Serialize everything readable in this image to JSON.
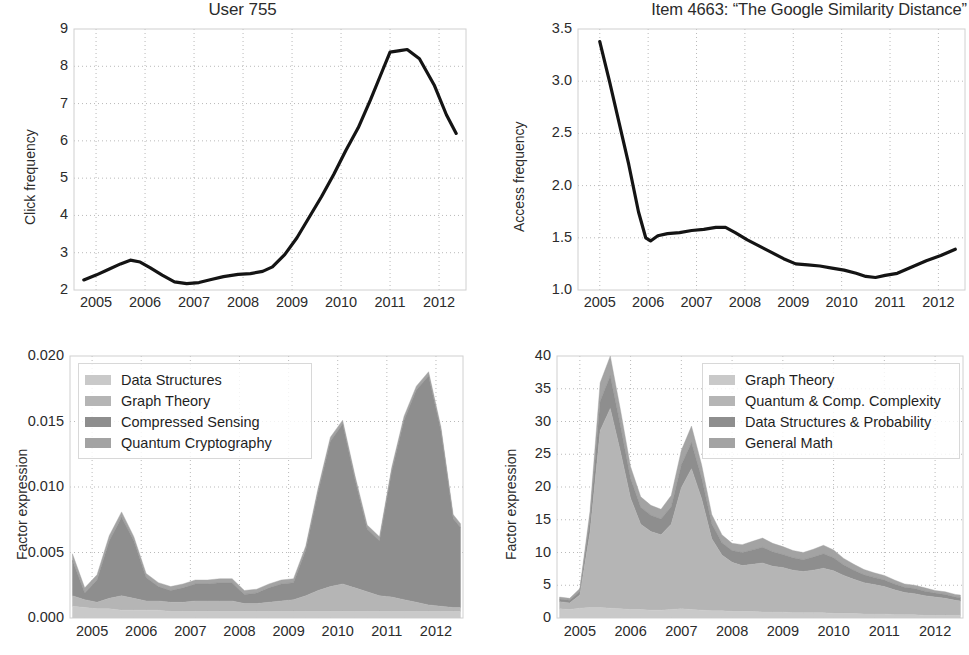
{
  "figure": {
    "width": 969,
    "height": 655,
    "background": "#ffffff",
    "line_color": "#141414",
    "grid_color": "#b9b9b9",
    "frame_color": "#d0d0d0",
    "text_color": "#2b2b2b"
  },
  "panels": {
    "top_left": {
      "title": "User 755",
      "ylabel": "Click frequency",
      "xticks": [
        "2005",
        "2006",
        "2007",
        "2008",
        "2009",
        "2010",
        "2011",
        "2012"
      ],
      "yticks": [
        "2",
        "3",
        "4",
        "5",
        "6",
        "7",
        "8",
        "9"
      ]
    },
    "top_right": {
      "title": "Item 4663: “The Google Similarity Distance”",
      "ylabel": "Access frequency",
      "xticks": [
        "2005",
        "2006",
        "2007",
        "2008",
        "2009",
        "2010",
        "2011",
        "2012"
      ],
      "yticks": [
        "1.0",
        "1.5",
        "2.0",
        "2.5",
        "3.0",
        "3.5"
      ]
    },
    "bottom_left": {
      "ylabel": "Factor expression",
      "xticks": [
        "2005",
        "2006",
        "2007",
        "2008",
        "2009",
        "2010",
        "2011",
        "2012"
      ],
      "yticks": [
        "0.000",
        "0.005",
        "0.010",
        "0.015",
        "0.020"
      ],
      "legend": [
        {
          "label": "Data Structures",
          "color": "#c9c9c9"
        },
        {
          "label": "Graph Theory",
          "color": "#b5b5b5"
        },
        {
          "label": "Compressed Sensing",
          "color": "#8e8e8e"
        },
        {
          "label": "Quantum Cryptography",
          "color": "#a3a3a3"
        }
      ]
    },
    "bottom_right": {
      "ylabel": "Factor expression",
      "xticks": [
        "2005",
        "2006",
        "2007",
        "2008",
        "2009",
        "2010",
        "2011",
        "2012"
      ],
      "yticks": [
        "0",
        "5",
        "10",
        "15",
        "20",
        "25",
        "30",
        "35",
        "40"
      ],
      "legend": [
        {
          "label": "Graph Theory",
          "color": "#c9c9c9"
        },
        {
          "label": "Quantum & Comp. Complexity",
          "color": "#b5b5b5"
        },
        {
          "label": "Data Structures & Probability",
          "color": "#8e8e8e"
        },
        {
          "label": "General Math",
          "color": "#a3a3a3"
        }
      ]
    }
  },
  "chart_data": [
    {
      "id": "user-755-click-frequency",
      "type": "line",
      "title": "User 755",
      "xlabel": "",
      "ylabel": "Click frequency",
      "xlim": [
        2004.55,
        2012.55
      ],
      "ylim": [
        2,
        9
      ],
      "grid": true,
      "legend": null,
      "x": [
        2004.75,
        2005.0,
        2005.25,
        2005.5,
        2005.7,
        2005.9,
        2006.1,
        2006.35,
        2006.6,
        2006.85,
        2007.1,
        2007.35,
        2007.6,
        2007.9,
        2008.15,
        2008.4,
        2008.6,
        2008.85,
        2009.1,
        2009.35,
        2009.6,
        2009.85,
        2010.1,
        2010.35,
        2010.6,
        2010.85,
        2011.0,
        2011.2,
        2011.35,
        2011.6,
        2011.9,
        2012.15,
        2012.35
      ],
      "values": [
        2.27,
        2.4,
        2.55,
        2.7,
        2.8,
        2.75,
        2.6,
        2.4,
        2.22,
        2.17,
        2.2,
        2.28,
        2.36,
        2.42,
        2.44,
        2.5,
        2.62,
        2.95,
        3.4,
        3.95,
        4.5,
        5.1,
        5.75,
        6.35,
        7.1,
        7.9,
        8.38,
        8.42,
        8.45,
        8.2,
        7.5,
        6.7,
        6.2
      ]
    },
    {
      "id": "item-4663-access-frequency",
      "type": "line",
      "title": "Item 4663: “The Google Similarity Distance”",
      "xlabel": "",
      "ylabel": "Access frequency",
      "xlim": [
        2004.55,
        2012.55
      ],
      "ylim": [
        1.0,
        3.5
      ],
      "grid": true,
      "legend": null,
      "x": [
        2005.0,
        2005.2,
        2005.4,
        2005.6,
        2005.8,
        2005.95,
        2006.05,
        2006.2,
        2006.4,
        2006.65,
        2006.9,
        2007.15,
        2007.4,
        2007.6,
        2007.8,
        2008.05,
        2008.3,
        2008.55,
        2008.8,
        2009.05,
        2009.3,
        2009.55,
        2009.8,
        2010.05,
        2010.3,
        2010.5,
        2010.7,
        2010.9,
        2011.15,
        2011.45,
        2011.75,
        2012.05,
        2012.35
      ],
      "values": [
        3.38,
        3.0,
        2.6,
        2.2,
        1.75,
        1.5,
        1.47,
        1.52,
        1.54,
        1.55,
        1.57,
        1.58,
        1.6,
        1.6,
        1.55,
        1.48,
        1.42,
        1.36,
        1.3,
        1.25,
        1.24,
        1.23,
        1.21,
        1.19,
        1.16,
        1.13,
        1.12,
        1.14,
        1.16,
        1.22,
        1.28,
        1.33,
        1.39
      ]
    },
    {
      "id": "user-755-factor-expression",
      "type": "area",
      "stacked": true,
      "title": "",
      "xlabel": "",
      "ylabel": "Factor expression",
      "xlim": [
        2004.55,
        2012.55
      ],
      "ylim": [
        0.0,
        0.02
      ],
      "grid": true,
      "legend_position": "upper-left",
      "x": [
        2004.6,
        2004.85,
        2005.1,
        2005.35,
        2005.6,
        2005.85,
        2006.1,
        2006.35,
        2006.6,
        2006.85,
        2007.1,
        2007.35,
        2007.6,
        2007.85,
        2008.1,
        2008.35,
        2008.6,
        2008.85,
        2009.1,
        2009.35,
        2009.6,
        2009.85,
        2010.1,
        2010.35,
        2010.6,
        2010.85,
        2011.1,
        2011.35,
        2011.6,
        2011.85,
        2012.1,
        2012.35,
        2012.5
      ],
      "series": [
        {
          "name": "Data Structures",
          "color": "#c9c9c9",
          "values": [
            0.0009,
            0.0008,
            0.0007,
            0.0007,
            0.0006,
            0.0006,
            0.0006,
            0.0006,
            0.0005,
            0.0005,
            0.0005,
            0.0005,
            0.0005,
            0.0005,
            0.0005,
            0.0005,
            0.0005,
            0.0005,
            0.0005,
            0.0005,
            0.0005,
            0.0005,
            0.0005,
            0.0005,
            0.0005,
            0.0005,
            0.0005,
            0.0005,
            0.0005,
            0.0005,
            0.0005,
            0.0005,
            0.0005
          ]
        },
        {
          "name": "Graph Theory",
          "color": "#b5b5b5",
          "values": [
            0.0008,
            0.0006,
            0.0005,
            0.0008,
            0.0011,
            0.0009,
            0.0007,
            0.0007,
            0.0007,
            0.0007,
            0.0008,
            0.0008,
            0.0008,
            0.0008,
            0.0006,
            0.0006,
            0.0007,
            0.0008,
            0.0009,
            0.0012,
            0.0016,
            0.0019,
            0.0021,
            0.0018,
            0.0015,
            0.0012,
            0.0011,
            0.0009,
            0.0007,
            0.0005,
            0.0004,
            0.0003,
            0.0003
          ]
        },
        {
          "name": "Compressed Sensing",
          "color": "#8e8e8e",
          "values": [
            0.0027,
            0.0005,
            0.0017,
            0.0044,
            0.006,
            0.0044,
            0.0018,
            0.0011,
            0.0009,
            0.0011,
            0.0013,
            0.0013,
            0.0014,
            0.0014,
            0.0007,
            0.0008,
            0.0011,
            0.0013,
            0.0013,
            0.0035,
            0.0075,
            0.0111,
            0.0122,
            0.0083,
            0.0048,
            0.0042,
            0.0096,
            0.0137,
            0.0162,
            0.0175,
            0.0134,
            0.0068,
            0.0061
          ]
        },
        {
          "name": "Quantum Cryptography",
          "color": "#a3a3a3",
          "values": [
            0.0005,
            0.0004,
            0.0004,
            0.0004,
            0.0004,
            0.0003,
            0.0003,
            0.0003,
            0.0003,
            0.0003,
            0.0003,
            0.0003,
            0.0003,
            0.0003,
            0.0003,
            0.0003,
            0.0003,
            0.0003,
            0.0003,
            0.0003,
            0.0003,
            0.0003,
            0.0003,
            0.0003,
            0.0003,
            0.0003,
            0.0003,
            0.0003,
            0.0003,
            0.0003,
            0.0003,
            0.0003,
            0.0003
          ]
        }
      ]
    },
    {
      "id": "item-4663-factor-expression",
      "type": "area",
      "stacked": true,
      "title": "",
      "xlabel": "",
      "ylabel": "Factor expression",
      "xlim": [
        2004.55,
        2012.55
      ],
      "ylim": [
        0,
        40
      ],
      "grid": true,
      "legend_position": "upper-right",
      "x": [
        2004.6,
        2004.8,
        2005.0,
        2005.2,
        2005.4,
        2005.6,
        2005.8,
        2006.0,
        2006.2,
        2006.4,
        2006.6,
        2006.8,
        2007.0,
        2007.2,
        2007.4,
        2007.6,
        2007.8,
        2008.0,
        2008.2,
        2008.4,
        2008.6,
        2008.8,
        2009.0,
        2009.2,
        2009.4,
        2009.6,
        2009.8,
        2010.0,
        2010.2,
        2010.4,
        2010.6,
        2010.8,
        2011.0,
        2011.2,
        2011.4,
        2011.6,
        2011.8,
        2012.0,
        2012.2,
        2012.4,
        2012.5
      ],
      "series": [
        {
          "name": "Graph Theory",
          "color": "#c9c9c9",
          "values": [
            1.4,
            1.3,
            1.5,
            1.6,
            1.6,
            1.5,
            1.4,
            1.3,
            1.3,
            1.2,
            1.2,
            1.3,
            1.4,
            1.3,
            1.2,
            1.1,
            1.1,
            1.0,
            1.0,
            1.0,
            0.9,
            0.9,
            0.9,
            0.8,
            0.8,
            0.8,
            0.8,
            0.7,
            0.7,
            0.7,
            0.6,
            0.6,
            0.6,
            0.5,
            0.5,
            0.5,
            0.4,
            0.4,
            0.4,
            0.4,
            0.4
          ]
        },
        {
          "name": "Quantum & Comp. Complexity",
          "color": "#b5b5b5",
          "values": [
            1.1,
            1.0,
            2.0,
            11.5,
            27.0,
            30.5,
            24.0,
            17.0,
            13.0,
            12.0,
            11.5,
            13.0,
            18.5,
            21.5,
            17.0,
            11.0,
            8.5,
            7.5,
            7.0,
            7.2,
            7.5,
            7.0,
            6.8,
            6.5,
            6.3,
            6.5,
            6.8,
            6.5,
            5.8,
            5.2,
            4.8,
            4.5,
            4.2,
            3.8,
            3.4,
            3.2,
            3.0,
            2.8,
            2.6,
            2.3,
            2.2
          ]
        },
        {
          "name": "Data Structures & Probability",
          "color": "#8e8e8e",
          "values": [
            0.4,
            0.4,
            0.6,
            2.0,
            4.5,
            5.0,
            4.0,
            3.0,
            2.6,
            2.5,
            2.4,
            2.7,
            3.5,
            4.0,
            3.2,
            2.3,
            1.9,
            1.8,
            2.0,
            2.2,
            2.4,
            2.2,
            2.0,
            1.9,
            1.8,
            2.0,
            2.2,
            2.0,
            1.6,
            1.4,
            1.2,
            1.1,
            1.0,
            0.9,
            0.8,
            0.8,
            0.7,
            0.6,
            0.6,
            0.5,
            0.5
          ]
        },
        {
          "name": "General Math",
          "color": "#a3a3a3",
          "values": [
            0.3,
            0.3,
            0.4,
            1.2,
            2.8,
            3.0,
            2.4,
            1.8,
            1.6,
            1.5,
            1.5,
            1.7,
            2.2,
            2.5,
            2.0,
            1.4,
            1.2,
            1.1,
            1.2,
            1.3,
            1.4,
            1.3,
            1.2,
            1.1,
            1.1,
            1.2,
            1.3,
            1.2,
            1.0,
            0.9,
            0.8,
            0.7,
            0.7,
            0.6,
            0.5,
            0.5,
            0.5,
            0.4,
            0.4,
            0.4,
            0.4
          ]
        }
      ]
    }
  ]
}
